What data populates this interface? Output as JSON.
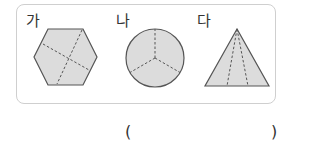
{
  "figures": [
    {
      "label": "가",
      "shape": "hexagon",
      "divisions": "dashed lines dividing hexagon into 4 parts"
    },
    {
      "label": "나",
      "shape": "circle",
      "divisions": "dashed lines dividing circle into 3 equal parts"
    },
    {
      "label": "다",
      "shape": "triangle",
      "divisions": "dashed lines from apex dividing triangle into 3 parts"
    }
  ],
  "answer": {
    "open_paren": "(",
    "close_paren": ")",
    "value": ""
  },
  "colors": {
    "fill": "#dcdcdc",
    "stroke": "#555555",
    "panel_border": "#cfcfcf"
  }
}
